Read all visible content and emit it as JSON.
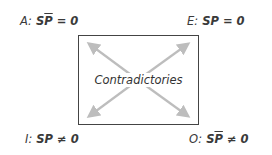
{
  "diagram": {
    "type": "square-of-opposition",
    "center_label": "Contradictories",
    "corners": {
      "top_left": {
        "letter": "A:",
        "formula_base": "S",
        "formula_bar": "P",
        "formula_rest": " = 0",
        "full": "A: SP̄ = 0"
      },
      "top_right": {
        "letter": "E:",
        "formula_base": "SP",
        "formula_bar": "",
        "formula_rest": " = 0",
        "full": "E: SP = 0"
      },
      "bottom_left": {
        "letter": "I:",
        "formula_base": "SP",
        "formula_bar": "",
        "formula_rest": " ≠ 0",
        "full": "I: SP ≠ 0"
      },
      "bottom_right": {
        "letter": "O:",
        "formula_base": "S",
        "formula_bar": "P",
        "formula_rest": " ≠ 0",
        "full": "O: SP̄ ≠ 0"
      }
    },
    "colors": {
      "arrow": "#bdbdbd",
      "box_border": "#444444",
      "text": "#3a3a3a"
    }
  }
}
